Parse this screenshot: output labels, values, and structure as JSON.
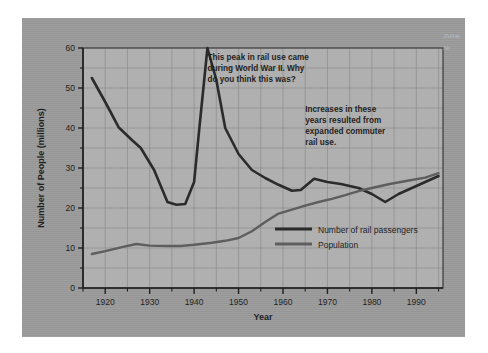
{
  "figure": {
    "panel_bg": "#9b9b9b",
    "plot_bg": "#b0b0b0",
    "grid_color": "#8a8a8a",
    "axis_color": "#2b2b2b"
  },
  "edge_fragment": {
    "text": "Th Po in Ne"
  },
  "chart_data": {
    "type": "line",
    "title": "",
    "xlabel": "Year",
    "ylabel": "Number of People (millions)",
    "xlim": [
      1915,
      1996
    ],
    "ylim": [
      0,
      60
    ],
    "xticks": [
      1920,
      1930,
      1940,
      1950,
      1960,
      1970,
      1980,
      1990
    ],
    "xtick_labels": [
      "1920",
      "1930",
      "1940",
      "1950",
      "1960",
      "1970",
      "1980",
      "1990"
    ],
    "yticks": [
      0,
      10,
      20,
      30,
      40,
      50,
      60
    ],
    "ytick_labels": [
      "0",
      "10",
      "20",
      "30",
      "40",
      "50",
      "60"
    ],
    "x_minor_step": 5,
    "y_minor_step": 5,
    "grid": true,
    "legend_position": "inside-lower-right",
    "series": [
      {
        "name": "Number of rail passengers",
        "color": "#2b2b2b",
        "width": 2.6,
        "x": [
          1917,
          1920,
          1923,
          1926,
          1928,
          1931,
          1934,
          1936,
          1938,
          1940,
          1941,
          1943,
          1945,
          1947,
          1950,
          1953,
          1956,
          1959,
          1962,
          1964,
          1967,
          1970,
          1973,
          1977,
          1980,
          1983,
          1986,
          1990,
          1995
        ],
        "y": [
          52.5,
          46.5,
          40.2,
          37.0,
          35.0,
          29.5,
          21.5,
          20.8,
          21.0,
          26.5,
          38.0,
          60.0,
          52.0,
          40.0,
          33.5,
          29.5,
          27.5,
          25.8,
          24.3,
          24.5,
          27.3,
          26.5,
          26.0,
          25.0,
          23.5,
          21.5,
          23.5,
          25.5,
          28.0
        ]
      },
      {
        "name": "Population",
        "color": "#5e5e5e",
        "width": 2.4,
        "x": [
          1917,
          1920,
          1924,
          1927,
          1930,
          1934,
          1937,
          1940,
          1944,
          1947,
          1950,
          1953,
          1956,
          1959,
          1962,
          1965,
          1968,
          1971,
          1974,
          1977,
          1980,
          1984,
          1988,
          1992,
          1995
        ],
        "y": [
          8.5,
          9.2,
          10.3,
          11.0,
          10.6,
          10.5,
          10.5,
          10.8,
          11.3,
          11.8,
          12.5,
          14.2,
          16.5,
          18.6,
          19.6,
          20.6,
          21.5,
          22.3,
          23.2,
          24.2,
          25.0,
          26.0,
          26.8,
          27.6,
          28.7
        ]
      }
    ],
    "annotations": [
      {
        "id": "wwii-peak-note",
        "lines": [
          "This peak in rail use came",
          "during World War II. Why",
          "do you think this was?"
        ],
        "x": 1943,
        "y": 57
      },
      {
        "id": "commuter-rail-note",
        "lines": [
          "Increases in these",
          "years resulted from",
          "expanded commuter",
          "rail use."
        ],
        "x": 1965,
        "y": 44
      }
    ]
  }
}
